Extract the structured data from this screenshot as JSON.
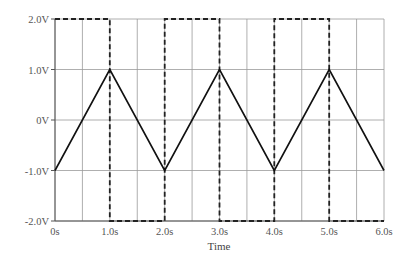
{
  "chart_data": {
    "type": "line",
    "title": "",
    "xlabel": "Time",
    "ylabel": "",
    "xlim": [
      0,
      6
    ],
    "ylim": [
      -2,
      2
    ],
    "grid": true,
    "x_ticks": [
      0,
      1,
      2,
      3,
      4,
      5,
      6
    ],
    "x_tick_labels": [
      "0s",
      "1.0s",
      "2.0s",
      "3.0s",
      "4.0s",
      "5.0s",
      "6.0s"
    ],
    "y_ticks": [
      2,
      1,
      0,
      -1,
      -2
    ],
    "y_tick_labels": [
      "2.0V",
      "1.0V",
      "0V",
      "-1.0V",
      "-2.0V"
    ],
    "series": [
      {
        "name": "square wave",
        "style": "dashed",
        "color": "#222222",
        "x": [
          0,
          1,
          1,
          2,
          2,
          3,
          3,
          4,
          4,
          5,
          5,
          6
        ],
        "values": [
          2,
          2,
          -2,
          -2,
          2,
          2,
          -2,
          -2,
          2,
          2,
          -2,
          -2
        ]
      },
      {
        "name": "triangle wave",
        "style": "solid",
        "color": "#111111",
        "x": [
          0,
          1,
          2,
          3,
          4,
          5,
          6
        ],
        "values": [
          -1,
          1,
          -1,
          1,
          -1,
          1,
          -1
        ]
      }
    ],
    "legend": null
  },
  "axes": {
    "x_title": "Time"
  }
}
